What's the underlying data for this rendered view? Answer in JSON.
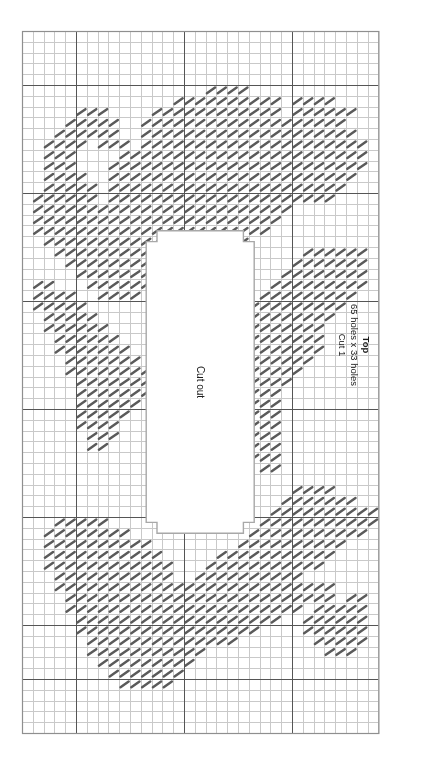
{
  "document": {
    "type": "plastic-canvas-stitch-chart",
    "piece_label": "Top",
    "dimensions_label": "65 holes x 33 holes",
    "cut_label": "Cut 1",
    "cutout_label": "Cut out"
  },
  "colors": {
    "stitch": "#5a5a5a",
    "grid_minor": "#c9c9c9",
    "grid_major": "#555555",
    "grid_border": "#8f8f8f",
    "cutout_outline": "#a8a8a8",
    "background": "#ffffff",
    "text": "#1a1a1a"
  },
  "chart_data": {
    "type": "heatmap",
    "title": "Top",
    "subtitle": "65 holes x 33 holes",
    "annotation": "Cut 1",
    "xlabel": "",
    "ylabel": "",
    "grid": true,
    "legend_position": "right",
    "cols": 33,
    "rows": 65,
    "cell_px": 10.8,
    "origin": {
      "x": 22,
      "y": 31
    },
    "major_every": 10,
    "major_lines_cols": [
      5,
      15,
      25
    ],
    "major_lines_rows": [
      5,
      15,
      25,
      35,
      45,
      55,
      60
    ],
    "cutout": {
      "label": "Cut out",
      "col_start": 11.5,
      "col_end": 21.5,
      "row_start": 18.5,
      "row_end": 46.5,
      "notch_depth": 1,
      "notch_cols": 1
    },
    "stitch_symbol": "diagonal-slash",
    "stitch_angle_deg": -35,
    "categories": [],
    "values": [],
    "regions": [
      {
        "name": "top-left-lobe",
        "desc": "dense diagonal fill sweeping from upper-left margin down-right"
      },
      {
        "name": "top-center-arc",
        "desc": "broad arc across upper third above cut out"
      },
      {
        "name": "top-right-lobe",
        "desc": "dense fill hugging right margin upper third"
      },
      {
        "name": "left-mid-band",
        "desc": "diagonal band along left of cut out"
      },
      {
        "name": "right-mid-band",
        "desc": "diagonal band along right of cut out"
      },
      {
        "name": "bottom-left-lobe",
        "desc": "dense fill lower-left"
      },
      {
        "name": "bottom-center-arc",
        "desc": "broad arc across lower third below cut out"
      },
      {
        "name": "bottom-right-lobe",
        "desc": "dense fill lower-right"
      }
    ]
  }
}
